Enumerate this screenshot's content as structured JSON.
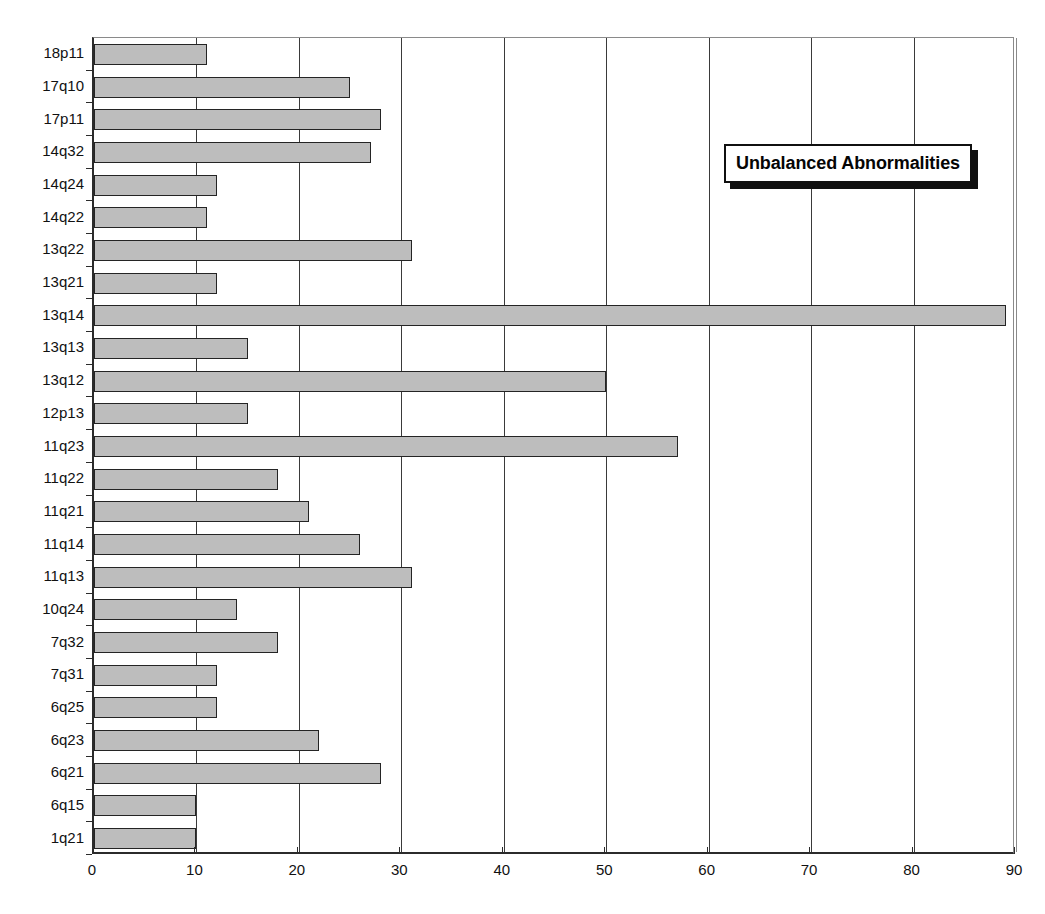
{
  "chart_data": {
    "type": "bar",
    "orientation": "horizontal",
    "title": "",
    "xlabel": "",
    "ylabel": "",
    "xlim": [
      0,
      90
    ],
    "xticks": [
      0,
      10,
      20,
      30,
      40,
      50,
      60,
      70,
      80,
      90
    ],
    "grid": "vertical",
    "legend_position": "upper-right",
    "legend": [
      "Unbalanced Abnormalities"
    ],
    "series_name": "Unbalanced Abnormalities",
    "bar_color": "#bdbdbd",
    "bar_edge_color": "#242424",
    "categories": [
      "18p11",
      "17q10",
      "17p11",
      "14q32",
      "14q24",
      "14q22",
      "13q22",
      "13q21",
      "13q14",
      "13q13",
      "13q12",
      "12p13",
      "11q23",
      "11q22",
      "11q21",
      "11q14",
      "11q13",
      "10q24",
      "7q32",
      "7q31",
      "6q25",
      "6q23",
      "6q21",
      "6q15",
      "1q21"
    ],
    "values": [
      11,
      25,
      28,
      27,
      12,
      11,
      31,
      12,
      89,
      15,
      50,
      15,
      57,
      18,
      21,
      26,
      31,
      14,
      18,
      12,
      12,
      22,
      28,
      10,
      10
    ]
  },
  "legend": {
    "label": "Unbalanced Abnormalities"
  }
}
